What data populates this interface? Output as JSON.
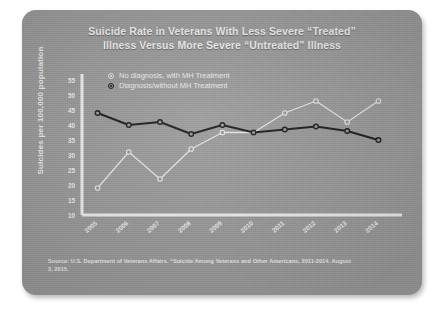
{
  "card": {
    "background_color": "#9b9b9b"
  },
  "title": {
    "line1": "Suicide Rate in Veterans With Less Severe “Treated”",
    "line2": "Illness Versus More Severe “Untreated” Illness"
  },
  "source": {
    "line1": "Source: U.S. Department of Veterans Affairs. “Suicide Among Veterans and Other Americans, 2011-2014. August",
    "line2": "3, 2015."
  },
  "chart_data": {
    "type": "line",
    "title": "Suicide Rate in Veterans With Less Severe “Treated” Illness Versus More Severe “Untreated” Illness",
    "xlabel": "",
    "ylabel": "Suicides per 100,000 population",
    "categories": [
      "2005",
      "2006",
      "2007",
      "2008",
      "2009",
      "2010",
      "2011",
      "2012",
      "2013",
      "2014"
    ],
    "ylim": [
      10,
      55
    ],
    "yticks": [
      10,
      15,
      20,
      25,
      30,
      35,
      40,
      45,
      50,
      55
    ],
    "grid": false,
    "legend_position": "top-center",
    "series": [
      {
        "name": "No diagnosis, with MH Treatment",
        "color": "#e8e8e8",
        "marker": "circle-open",
        "values": [
          19,
          31,
          22,
          32,
          37.5,
          37.5,
          44,
          48,
          41,
          48
        ]
      },
      {
        "name": "Diagnosis/without MH Treatment",
        "color": "#1c1c1c",
        "marker": "circle-open",
        "values": [
          44,
          40,
          41,
          37,
          40,
          37.5,
          38.5,
          39.5,
          38,
          35
        ]
      }
    ]
  }
}
